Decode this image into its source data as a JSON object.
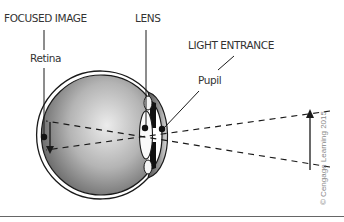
{
  "labels": {
    "focused_image": "FOCUSED IMAGE",
    "retina": "Retina",
    "lens": "LENS",
    "light_entrance": "LIGHT ENTRANCE",
    "pupil": "Pupil"
  },
  "copyright": "© Cengage Learning 2015",
  "colors": {
    "eyeball_gradient_light": "#e8e8e8",
    "eyeball_gradient_dark": "#6e6e6e",
    "outline": "#1a1a1a",
    "label_text": "#333333",
    "copyright_text": "#888888",
    "bottom_rule": "#666666"
  }
}
